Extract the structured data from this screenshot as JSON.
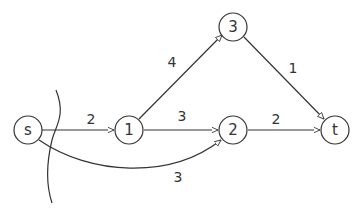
{
  "diagram": {
    "type": "flow-network",
    "nodes": [
      {
        "id": "s",
        "label": "s",
        "x": 28,
        "y": 130
      },
      {
        "id": "1",
        "label": "1",
        "x": 129,
        "y": 130
      },
      {
        "id": "2",
        "label": "2",
        "x": 233,
        "y": 130
      },
      {
        "id": "3",
        "label": "3",
        "x": 233,
        "y": 27
      },
      {
        "id": "t",
        "label": "t",
        "x": 335,
        "y": 130
      }
    ],
    "edges": [
      {
        "from": "s",
        "to": "1",
        "capacity": "2"
      },
      {
        "from": "1",
        "to": "3",
        "capacity": "4"
      },
      {
        "from": "1",
        "to": "2",
        "capacity": "3"
      },
      {
        "from": "s",
        "to": "2",
        "capacity": "3"
      },
      {
        "from": "3",
        "to": "t",
        "capacity": "1"
      },
      {
        "from": "2",
        "to": "t",
        "capacity": "2"
      }
    ],
    "cut": {
      "label": "s-t cut curve",
      "separates": [
        "s"
      ]
    }
  }
}
